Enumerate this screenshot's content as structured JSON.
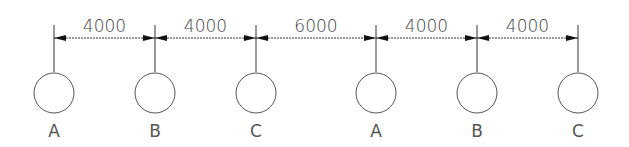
{
  "diagram": {
    "title": "",
    "stroke_color": "#333333",
    "dim_line_y": 38,
    "ext_line_top": 25,
    "ext_line_bottom": 72,
    "circle_cy": 93,
    "circle_r": 20,
    "label_y": 137,
    "axes": [
      {
        "x": 54,
        "label": "A"
      },
      {
        "x": 155,
        "label": "B"
      },
      {
        "x": 256,
        "label": "C"
      },
      {
        "x": 376,
        "label": "A"
      },
      {
        "x": 477,
        "label": "B"
      },
      {
        "x": 578,
        "label": "C"
      }
    ],
    "dimensions": [
      {
        "from": 0,
        "to": 1,
        "value": "4000"
      },
      {
        "from": 1,
        "to": 2,
        "value": "4000"
      },
      {
        "from": 2,
        "to": 3,
        "value": "6000"
      },
      {
        "from": 3,
        "to": 4,
        "value": "4000"
      },
      {
        "from": 4,
        "to": 5,
        "value": "4000"
      }
    ]
  }
}
